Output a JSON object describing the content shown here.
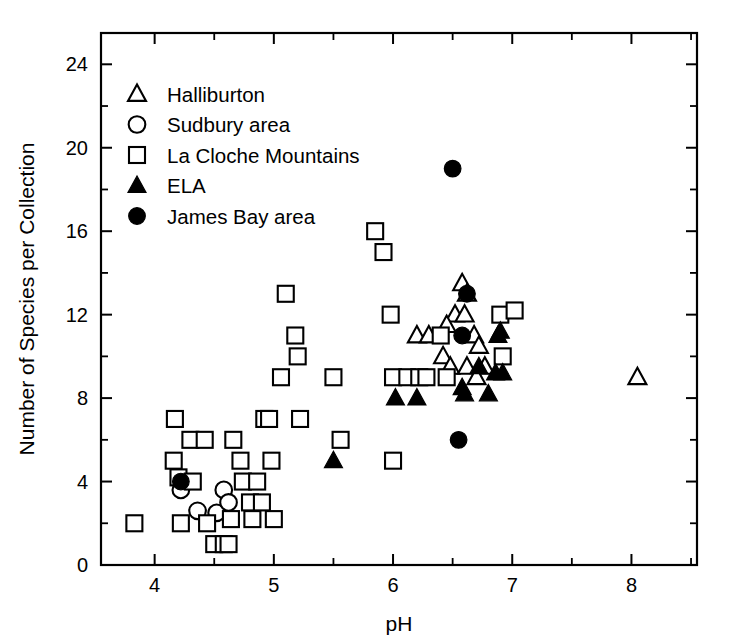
{
  "chart_data": {
    "type": "scatter",
    "title": "",
    "xlabel": "pH",
    "ylabel": "Number of Species per Collection",
    "xlim": [
      3.55,
      8.55
    ],
    "ylim": [
      0,
      25.5
    ],
    "xticks": [
      4,
      5,
      6,
      7,
      8
    ],
    "xtick_labels": [
      "4",
      "5",
      "6",
      "7",
      "8"
    ],
    "xminor_step": 0.5,
    "yticks": [
      0,
      4,
      8,
      12,
      16,
      20,
      24
    ],
    "ytick_labels": [
      "0",
      "4",
      "8",
      "12",
      "16",
      "20",
      "24"
    ],
    "yminor_step": 2,
    "grid": false,
    "legend_position": "upper-left-inside",
    "marker_color": "#000000",
    "series": [
      {
        "name": "Halliburton",
        "marker": "open-triangle",
        "points": [
          [
            6.2,
            11.0
          ],
          [
            6.3,
            11.0
          ],
          [
            6.42,
            10.0
          ],
          [
            6.58,
            13.5
          ],
          [
            6.62,
            13.0
          ],
          [
            6.52,
            12.0
          ],
          [
            6.6,
            12.0
          ],
          [
            6.45,
            11.5
          ],
          [
            6.68,
            11.0
          ],
          [
            6.72,
            10.5
          ],
          [
            6.48,
            9.5
          ],
          [
            6.62,
            9.5
          ],
          [
            6.77,
            9.5
          ],
          [
            6.7,
            9.0
          ],
          [
            8.05,
            9.0
          ]
        ]
      },
      {
        "name": "Sudbury area",
        "marker": "open-circle",
        "points": [
          [
            4.22,
            3.6
          ],
          [
            4.36,
            2.6
          ],
          [
            4.52,
            2.5
          ],
          [
            4.58,
            3.6
          ],
          [
            4.62,
            3.0
          ]
        ]
      },
      {
        "name": "La Cloche Mountains",
        "marker": "open-square",
        "points": [
          [
            3.83,
            2.0
          ],
          [
            4.16,
            5.0
          ],
          [
            4.17,
            7.0
          ],
          [
            4.2,
            4.2
          ],
          [
            4.22,
            2.0
          ],
          [
            4.3,
            6.0
          ],
          [
            4.32,
            4.0
          ],
          [
            4.42,
            6.0
          ],
          [
            4.44,
            2.0
          ],
          [
            4.5,
            1.0
          ],
          [
            4.58,
            1.0
          ],
          [
            4.62,
            1.0
          ],
          [
            4.64,
            2.2
          ],
          [
            4.66,
            6.0
          ],
          [
            4.72,
            5.0
          ],
          [
            4.74,
            4.0
          ],
          [
            4.8,
            3.0
          ],
          [
            4.82,
            2.2
          ],
          [
            4.86,
            4.0
          ],
          [
            4.9,
            3.0
          ],
          [
            4.92,
            7.0
          ],
          [
            4.96,
            7.0
          ],
          [
            4.98,
            5.0
          ],
          [
            5.0,
            2.2
          ],
          [
            5.06,
            9.0
          ],
          [
            5.1,
            13.0
          ],
          [
            5.18,
            11.0
          ],
          [
            5.2,
            10.0
          ],
          [
            5.22,
            7.0
          ],
          [
            5.5,
            9.0
          ],
          [
            5.56,
            6.0
          ],
          [
            5.85,
            16.0
          ],
          [
            5.92,
            15.0
          ],
          [
            5.98,
            12.0
          ],
          [
            6.0,
            9.0
          ],
          [
            6.0,
            5.0
          ],
          [
            6.12,
            9.0
          ],
          [
            6.22,
            9.0
          ],
          [
            6.28,
            9.0
          ],
          [
            6.4,
            11.0
          ],
          [
            6.45,
            9.0
          ],
          [
            6.9,
            12.0
          ],
          [
            6.92,
            10.0
          ],
          [
            7.02,
            12.2
          ]
        ]
      },
      {
        "name": "ELA",
        "marker": "filled-triangle",
        "points": [
          [
            5.5,
            5.0
          ],
          [
            6.02,
            8.0
          ],
          [
            6.2,
            8.0
          ],
          [
            6.58,
            8.5
          ],
          [
            6.6,
            8.2
          ],
          [
            6.72,
            9.5
          ],
          [
            6.8,
            8.2
          ],
          [
            6.86,
            9.2
          ],
          [
            6.92,
            9.2
          ],
          [
            6.88,
            11.0
          ],
          [
            6.9,
            11.2
          ]
        ]
      },
      {
        "name": "James Bay area",
        "marker": "filled-circle",
        "points": [
          [
            4.22,
            4.0
          ],
          [
            6.5,
            19.0
          ],
          [
            6.62,
            13.0
          ],
          [
            6.58,
            11.0
          ],
          [
            6.55,
            6.0
          ]
        ]
      }
    ]
  },
  "legend": {
    "entries": [
      {
        "marker": "open-triangle",
        "label": "Halliburton"
      },
      {
        "marker": "open-circle",
        "label": "Sudbury area"
      },
      {
        "marker": "open-square",
        "label": "La Cloche Mountains"
      },
      {
        "marker": "filled-triangle",
        "label": "ELA"
      },
      {
        "marker": "filled-circle",
        "label": "James Bay area"
      }
    ]
  }
}
